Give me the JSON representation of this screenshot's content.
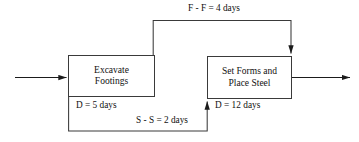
{
  "diagram": {
    "type": "precedence-network",
    "background_color": "#ffffff",
    "line_color": "#3a3a3a",
    "text_color": "#111111",
    "nodes": [
      {
        "id": "excavate",
        "title_line_1": "Excavate",
        "title_line_2": "Footings",
        "duration_label": "D = 5 days"
      },
      {
        "id": "setforms",
        "title_line_1": "Set Forms and",
        "title_line_2": "Place Steel",
        "duration_label": "D = 12 days"
      }
    ],
    "edges": [
      {
        "id": "finish-to-finish",
        "label": "F - F = 4 days",
        "from": "excavate",
        "to": "setforms",
        "routing": "top",
        "arrow_direction": "down"
      },
      {
        "id": "start-to-start",
        "label": "S - S = 2 days",
        "from": "excavate",
        "to": "setforms",
        "routing": "bottom",
        "arrow_direction": "up"
      },
      {
        "id": "entry",
        "label": "",
        "routing": "left",
        "arrow_direction": "right"
      },
      {
        "id": "exit",
        "label": "",
        "routing": "right",
        "arrow_direction": "right"
      }
    ]
  }
}
